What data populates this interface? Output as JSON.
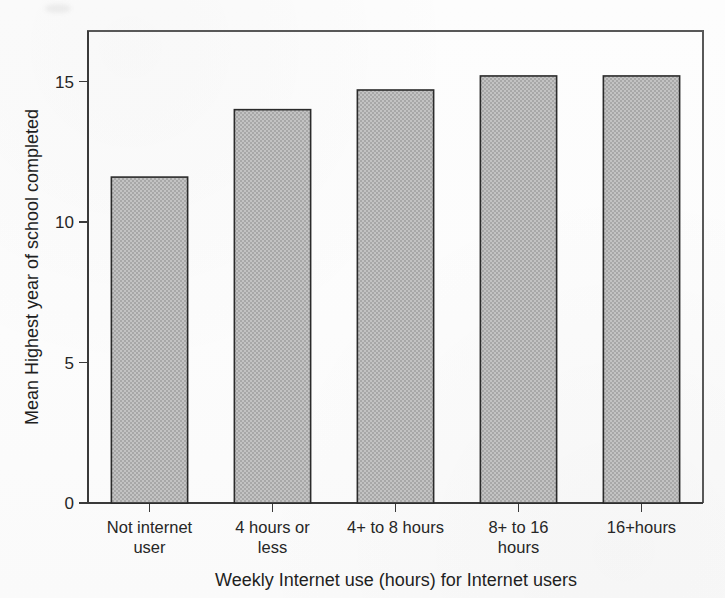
{
  "chart_data": {
    "type": "bar",
    "title": "",
    "subtitle": "",
    "xlabel": "Weekly Internet use (hours) for Internet users",
    "ylabel": "Mean Highest year of school completed",
    "categories": [
      "Not internet user",
      "4 hours or less",
      "4+ to 8 hours",
      "8+ to 16 hours",
      "16+hours"
    ],
    "category_lines": [
      [
        "Not internet",
        "user"
      ],
      [
        "4 hours or",
        "less"
      ],
      [
        "4+ to 8 hours"
      ],
      [
        "8+ to 16",
        "hours"
      ],
      [
        "16+hours"
      ]
    ],
    "values": [
      11.6,
      14.0,
      14.7,
      15.2,
      15.2
    ],
    "ylim": [
      0,
      16.8
    ],
    "yticks": [
      0,
      5,
      10,
      15
    ],
    "ytick_labels": [
      "0",
      "5",
      "10",
      "15"
    ],
    "grid": false,
    "legend": "none",
    "bar_fill_color": "#b6b6b6",
    "bar_edge_color": "#2b2b2b",
    "axis_color": "#3a3a3a",
    "background_color": "#fdfdfd"
  },
  "figure": {
    "plot_left": 88,
    "plot_right": 703,
    "plot_top": 31,
    "plot_bottom": 503
  }
}
